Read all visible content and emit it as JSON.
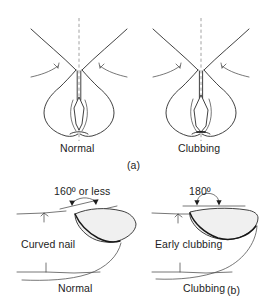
{
  "figure": {
    "background_color": "#ffffff",
    "ink_color": "#2b2b2b",
    "text_color": "#1d1d1d"
  },
  "panel_a": {
    "panel_label": "(a)",
    "description": "Schamroth window test, dorsal view of opposed fingernails",
    "left": {
      "caption": "Normal",
      "window_state": "diamond window present"
    },
    "right": {
      "caption": "Clubbing",
      "window_state": "window obliterated"
    }
  },
  "panel_b": {
    "panel_label": "(b)",
    "description": "Lateral profile of nail fold angle",
    "left": {
      "angle_label": "160º or less",
      "nail_label": "Curved nail",
      "caption": "Normal"
    },
    "right": {
      "angle_label": "180º",
      "nail_label": "Early clubbing",
      "caption": "Clubbing"
    }
  }
}
